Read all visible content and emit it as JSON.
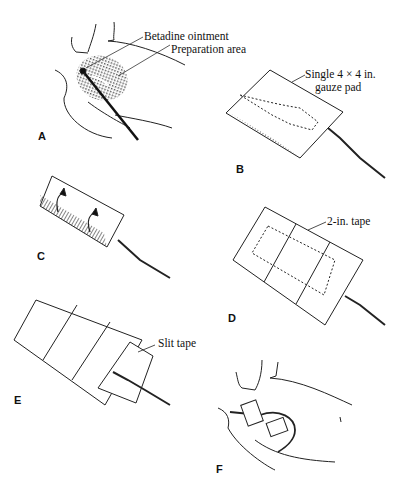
{
  "figure": {
    "panels": [
      {
        "id": "A",
        "label": "A",
        "annotations": [
          "Betadine ointment",
          "Preparation area"
        ]
      },
      {
        "id": "B",
        "label": "B",
        "annotations": [
          "Single 4 × 4 in.",
          "gauze pad"
        ]
      },
      {
        "id": "C",
        "label": "C",
        "annotations": []
      },
      {
        "id": "D",
        "label": "D",
        "annotations": [
          "2-in. tape"
        ]
      },
      {
        "id": "E",
        "label": "E",
        "annotations": [
          "Slit tape"
        ]
      },
      {
        "id": "F",
        "label": "F",
        "annotations": []
      }
    ]
  }
}
